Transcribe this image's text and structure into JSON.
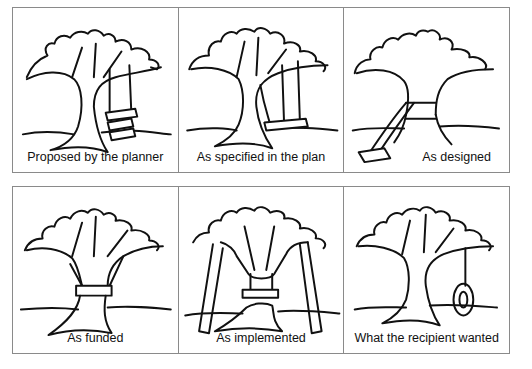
{
  "panels": [
    {
      "caption": "Proposed by the planner",
      "depiction": "tree with three-tier stacked swing seats hanging from branch"
    },
    {
      "caption": "As specified in the plan",
      "depiction": "tree with swing hanging from branch, one rope passes through trunk"
    },
    {
      "caption": "As designed",
      "depiction": "swing ropes wrapped around trunk, seat lying on the ground"
    },
    {
      "caption": "As funded",
      "depiction": "single board strapped around tree trunk"
    },
    {
      "caption": "As implemented",
      "depiction": "trunk cut out, seat hung inside, branches propped by poles"
    },
    {
      "caption": "What the recipient wanted",
      "depiction": "tree with a tire swing hanging on a single rope"
    }
  ]
}
